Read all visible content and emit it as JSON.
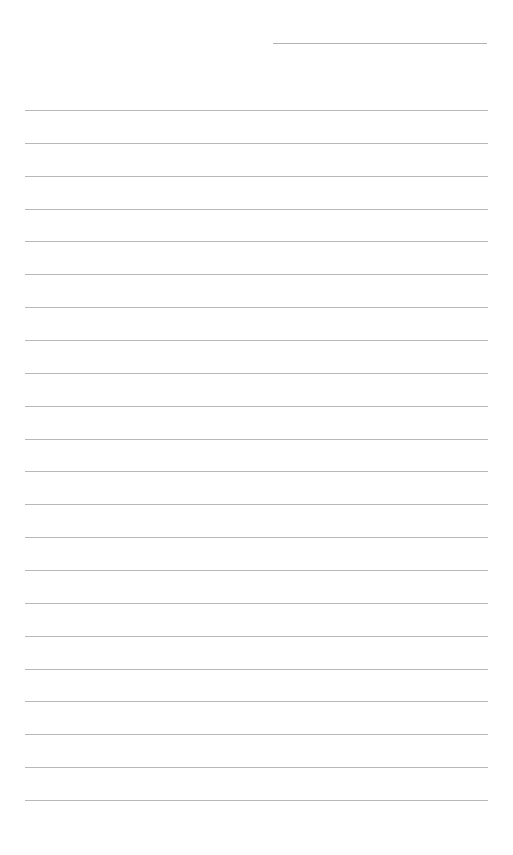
{
  "page": {
    "type": "blank lined paper",
    "line_color": "#9a9a9a",
    "background": "#ffffff",
    "header_line": {
      "label": ""
    },
    "ruled_lines": [
      {
        "text": ""
      },
      {
        "text": ""
      },
      {
        "text": ""
      },
      {
        "text": ""
      },
      {
        "text": ""
      },
      {
        "text": ""
      },
      {
        "text": ""
      },
      {
        "text": ""
      },
      {
        "text": ""
      },
      {
        "text": ""
      },
      {
        "text": ""
      },
      {
        "text": ""
      },
      {
        "text": ""
      },
      {
        "text": ""
      },
      {
        "text": ""
      },
      {
        "text": ""
      },
      {
        "text": ""
      },
      {
        "text": ""
      },
      {
        "text": ""
      },
      {
        "text": ""
      },
      {
        "text": ""
      },
      {
        "text": ""
      }
    ]
  }
}
